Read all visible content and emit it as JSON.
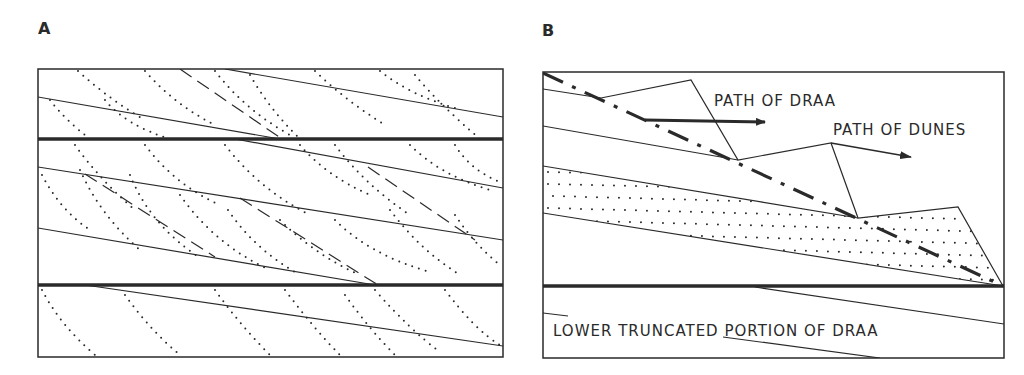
{
  "panels": {
    "a": {
      "label": "A",
      "description": "Cross-section of climbing bedforms: parallel sloping draa bounding surfaces truncated by horizontal bounding surfaces, with dotted dune cross-strata and dashed dune paths"
    },
    "b": {
      "label": "B",
      "description": "Schematic showing path of draa (dash-dot line) and path of dunes (zigzag), with dotted dune deposit and lower truncated draa",
      "annotations": {
        "path_of_draa": "PATH OF DRAA",
        "path_of_dunes": "PATH OF DUNES",
        "lower_truncated": "LOWER TRUNCATED PORTION OF DRAA"
      }
    }
  },
  "colors": {
    "ink": "#2a2a2a",
    "background": "#ffffff"
  }
}
